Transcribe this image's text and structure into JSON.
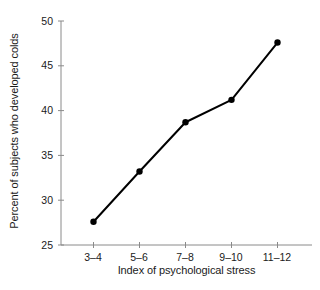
{
  "chart_data": {
    "type": "line",
    "title": "",
    "subtitle": "",
    "xlabel": "Index of psychological stress",
    "ylabel": "Percent of subjects who developed colds",
    "categories": [
      "3–4",
      "5–6",
      "7–8",
      "9–10",
      "11–12"
    ],
    "values": [
      27.6,
      33.2,
      38.7,
      41.2,
      47.6
    ],
    "series": [
      {
        "name": "Percent who developed colds",
        "values": [
          27.6,
          33.2,
          38.7,
          41.2,
          47.6
        ]
      }
    ],
    "ylim": [
      25,
      50
    ],
    "yticks": [
      25,
      30,
      35,
      40,
      45,
      50
    ],
    "ytick_labels": [
      "25",
      "30",
      "35",
      "40",
      "45",
      "50"
    ],
    "xticks": [
      0,
      1,
      2,
      3,
      4
    ],
    "xtick_labels": [
      "3–4",
      "5–6",
      "7–8",
      "9–10",
      "11–12"
    ],
    "grid": false,
    "legend": false,
    "legend_position": "none",
    "marker": "filled-circle",
    "line_color": "#000000",
    "marker_color": "#000000",
    "axis_color": "#808080",
    "background_color": "#ffffff"
  },
  "geometry": {
    "plot_left": 61,
    "plot_right": 312,
    "plot_top": 21,
    "plot_bottom": 245,
    "point_x": [
      93.5,
      139.5,
      185.5,
      231.5,
      277.5
    ],
    "point_y": [
      223.0,
      172.0,
      124.5,
      102.0,
      42.5
    ],
    "ytick_y": [
      245,
      200.2,
      155.4,
      110.6,
      65.8,
      21
    ],
    "xtick_x": [
      93.5,
      139.5,
      185.5,
      231.5,
      277.5
    ]
  }
}
